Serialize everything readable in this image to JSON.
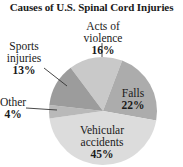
{
  "chart_data": {
    "type": "pie",
    "title": "Causes of U.S. Spinal Cord Injuries",
    "unit": "%",
    "slices": [
      {
        "label": "Acts of violence",
        "value": 16,
        "color": "#c9c9c9"
      },
      {
        "label": "Falls",
        "value": 22,
        "color": "#acacac"
      },
      {
        "label": "Vehicular accidents",
        "value": 45,
        "color": "#dcdcdc"
      },
      {
        "label": "Other",
        "value": 4,
        "color": "#b9b9b9"
      },
      {
        "label": "Sports injuries",
        "value": 13,
        "color": "#9c9c9c"
      }
    ],
    "start_angle_deg": -36.8,
    "direction": "clockwise",
    "legend": "none (direct labels)"
  },
  "labels": {
    "violence": {
      "line1": "Acts of violence",
      "pct": "16%"
    },
    "falls": {
      "line1": "Falls",
      "pct": "22%"
    },
    "vehicular": {
      "line1": "Vehicular",
      "line2": "accidents",
      "pct": "45%"
    },
    "other": {
      "line1": "Other",
      "pct": "4%"
    },
    "sports": {
      "line1": "Sports",
      "line2": "injuries",
      "pct": "13%"
    }
  }
}
